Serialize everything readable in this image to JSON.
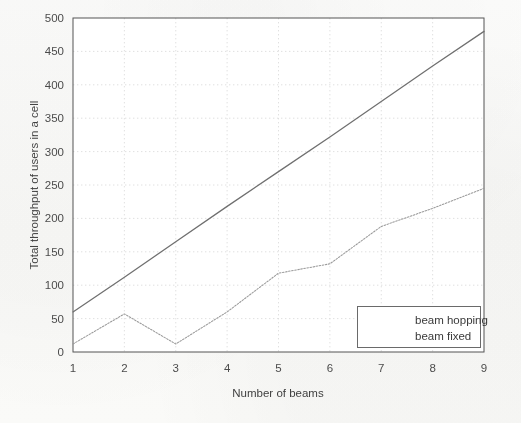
{
  "figure": {
    "background_color": "#fbfbfa",
    "plot_background_color": "#ffffff",
    "axis_color": "#555555",
    "grid_color": "#d8d8d8"
  },
  "chart_data": {
    "type": "line",
    "title": "",
    "xlabel": "Number of beams",
    "ylabel": "Total throughput of users in a cell",
    "xlim": [
      1,
      9
    ],
    "ylim": [
      0,
      500
    ],
    "x": [
      1,
      2,
      3,
      4,
      5,
      6,
      7,
      8,
      9
    ],
    "xticks": [
      "1",
      "2",
      "3",
      "4",
      "5",
      "6",
      "7",
      "8",
      "9"
    ],
    "yticks": [
      "0",
      "50",
      "100",
      "150",
      "200",
      "250",
      "300",
      "350",
      "400",
      "450",
      "500"
    ],
    "grid": true,
    "legend_position": "lower right",
    "series": [
      {
        "name": "beam hopping",
        "style": "solid",
        "color": "#6f6f6f",
        "values": [
          60,
          112,
          165,
          218,
          270,
          322,
          375,
          428,
          480
        ]
      },
      {
        "name": "beam fixed",
        "style": "dotted",
        "color": "#9a9a9a",
        "values": [
          12,
          57,
          12,
          60,
          118,
          132,
          188,
          215,
          245
        ]
      }
    ]
  },
  "legend": {
    "items": [
      {
        "label": "beam hopping",
        "style": "solid",
        "color": "#6f6f6f"
      },
      {
        "label": "beam fixed",
        "style": "dotted",
        "color": "#9a9a9a"
      }
    ]
  },
  "axes": {
    "x_tick_labels": [
      "1",
      "2",
      "3",
      "4",
      "5",
      "6",
      "7",
      "8",
      "9"
    ],
    "y_tick_labels": [
      "0",
      "50",
      "100",
      "150",
      "200",
      "250",
      "300",
      "350",
      "400",
      "450",
      "500"
    ],
    "x_axis_title": "Number of beams",
    "y_axis_title": "Total throughput of users in a cell"
  }
}
